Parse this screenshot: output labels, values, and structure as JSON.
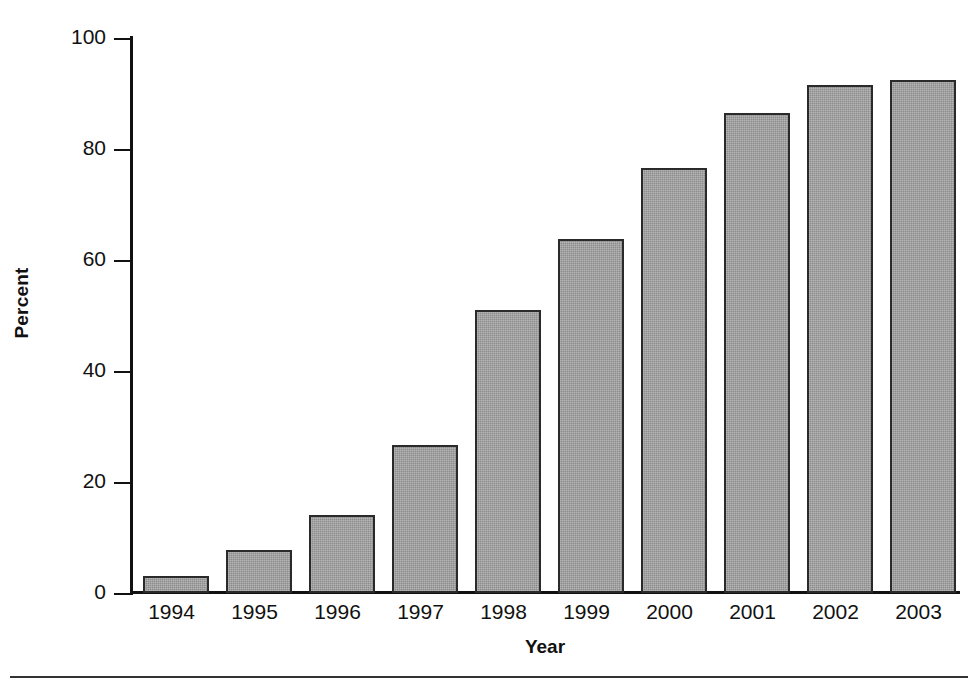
{
  "chart_data": {
    "type": "bar",
    "title": "",
    "xlabel": "Year",
    "ylabel": "Percent",
    "categories": [
      "1994",
      "1995",
      "1996",
      "1997",
      "1998",
      "1999",
      "2000",
      "2001",
      "2002",
      "2003"
    ],
    "values": [
      3.0,
      7.8,
      14.0,
      26.6,
      51.0,
      63.8,
      76.6,
      86.5,
      91.5,
      92.5
    ],
    "ylim": [
      0,
      100
    ],
    "yticks": [
      0,
      20,
      40,
      60,
      80,
      100
    ],
    "ytick_labels": [
      "0",
      "20",
      "40",
      "60",
      "80",
      "100"
    ],
    "grid": false,
    "legend": null,
    "bar_color": "#8c8c8c",
    "bar_edge_color": "#2a2a2a",
    "axis_color": "#111111",
    "background": "#ffffff"
  },
  "figure": {
    "footer_rule": true
  }
}
